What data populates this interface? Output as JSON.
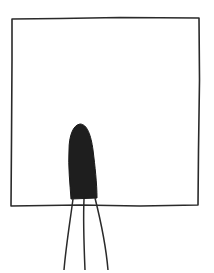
{
  "drawing": {
    "description": "Hand-drawn sketch of a square frame with a dark elongated shape at the bottom center and three lines extending downward",
    "colors": {
      "background": "#ffffff",
      "stroke": "#2a2a2a",
      "fill": "#1e1e1e"
    },
    "frame": {
      "points": [
        [
          12,
          19
        ],
        [
          60,
          18
        ],
        [
          120,
          17
        ],
        [
          199,
          18
        ],
        [
          199,
          80
        ],
        [
          198,
          150
        ],
        [
          198,
          205
        ],
        [
          140,
          206
        ],
        [
          80,
          205
        ],
        [
          11,
          206
        ],
        [
          11,
          140
        ],
        [
          12,
          60
        ]
      ]
    },
    "blob": {
      "top": [
        80,
        124
      ],
      "left_bottom": [
        71,
        199
      ],
      "right_bottom": [
        97,
        198
      ]
    },
    "legs": [
      {
        "from": [
          73,
          199
        ],
        "to": [
          64,
          270
        ]
      },
      {
        "from": [
          84,
          199
        ],
        "to": [
          85,
          270
        ]
      },
      {
        "from": [
          95,
          198
        ],
        "to": [
          108,
          270
        ]
      }
    ]
  }
}
